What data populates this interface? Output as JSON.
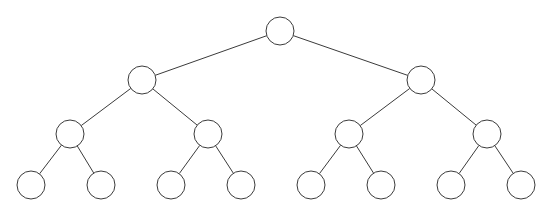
{
  "figure": {
    "name": "binary-tree-diagram",
    "width": 545,
    "height": 215,
    "background_color": "#ffffff",
    "stroke_color": "#3b3b3b",
    "node_fill_color": "#ffffff",
    "node_radius": 14,
    "stroke_width": 1,
    "node_count": 15,
    "edge_count": 14,
    "levels": 4,
    "caption": ""
  },
  "nodes": [
    {
      "id": "n0",
      "label": "",
      "level": 0,
      "cx": 280,
      "cy": 31,
      "r": 14,
      "role": "root"
    },
    {
      "id": "n1",
      "label": "",
      "level": 1,
      "cx": 142,
      "cy": 80,
      "r": 14,
      "role": "internal"
    },
    {
      "id": "n2",
      "label": "",
      "level": 1,
      "cx": 421,
      "cy": 80,
      "r": 14,
      "role": "internal"
    },
    {
      "id": "n3",
      "label": "",
      "level": 2,
      "cx": 70,
      "cy": 134,
      "r": 14,
      "role": "internal"
    },
    {
      "id": "n4",
      "label": "",
      "level": 2,
      "cx": 208,
      "cy": 134,
      "r": 14,
      "role": "internal"
    },
    {
      "id": "n5",
      "label": "",
      "level": 2,
      "cx": 349,
      "cy": 134,
      "r": 14,
      "role": "internal"
    },
    {
      "id": "n6",
      "label": "",
      "level": 2,
      "cx": 487,
      "cy": 134,
      "r": 14,
      "role": "internal"
    },
    {
      "id": "n7",
      "label": "",
      "level": 3,
      "cx": 31,
      "cy": 185,
      "r": 14,
      "role": "leaf"
    },
    {
      "id": "n8",
      "label": "",
      "level": 3,
      "cx": 101,
      "cy": 185,
      "r": 14,
      "role": "leaf"
    },
    {
      "id": "n9",
      "label": "",
      "level": 3,
      "cx": 171,
      "cy": 185,
      "r": 14,
      "role": "leaf"
    },
    {
      "id": "n10",
      "label": "",
      "level": 3,
      "cx": 241,
      "cy": 185,
      "r": 14,
      "role": "leaf"
    },
    {
      "id": "n11",
      "label": "",
      "level": 3,
      "cx": 311,
      "cy": 185,
      "r": 14,
      "role": "leaf"
    },
    {
      "id": "n12",
      "label": "",
      "level": 3,
      "cx": 381,
      "cy": 185,
      "r": 14,
      "role": "leaf"
    },
    {
      "id": "n13",
      "label": "",
      "level": 3,
      "cx": 451,
      "cy": 185,
      "r": 14,
      "role": "leaf"
    },
    {
      "id": "n14",
      "label": "",
      "level": 3,
      "cx": 521,
      "cy": 185,
      "r": 14,
      "role": "leaf"
    }
  ],
  "edges": [
    {
      "id": "e0",
      "from": "n0",
      "to": "n1"
    },
    {
      "id": "e1",
      "from": "n0",
      "to": "n2"
    },
    {
      "id": "e2",
      "from": "n1",
      "to": "n3"
    },
    {
      "id": "e3",
      "from": "n1",
      "to": "n4"
    },
    {
      "id": "e4",
      "from": "n2",
      "to": "n5"
    },
    {
      "id": "e5",
      "from": "n2",
      "to": "n6"
    },
    {
      "id": "e6",
      "from": "n3",
      "to": "n7"
    },
    {
      "id": "e7",
      "from": "n3",
      "to": "n8"
    },
    {
      "id": "e8",
      "from": "n4",
      "to": "n9"
    },
    {
      "id": "e9",
      "from": "n4",
      "to": "n10"
    },
    {
      "id": "e10",
      "from": "n5",
      "to": "n11"
    },
    {
      "id": "e11",
      "from": "n5",
      "to": "n12"
    },
    {
      "id": "e12",
      "from": "n6",
      "to": "n13"
    },
    {
      "id": "e13",
      "from": "n6",
      "to": "n14"
    }
  ]
}
